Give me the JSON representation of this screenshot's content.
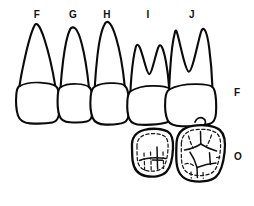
{
  "figure": {
    "kind": "dental-anatomy-line-drawing",
    "background_color": "#ffffff",
    "ink_color": "#0a0a0a",
    "tooth_labels": [
      {
        "id": "tooth-label-f",
        "text": "F",
        "x": 30
      },
      {
        "id": "tooth-label-g",
        "text": "G",
        "x": 66
      },
      {
        "id": "tooth-label-h",
        "text": "H",
        "x": 100
      },
      {
        "id": "tooth-label-i",
        "text": "I",
        "x": 141
      },
      {
        "id": "tooth-label-j",
        "text": "J",
        "x": 185
      }
    ],
    "view_labels": [
      {
        "id": "view-label-facial",
        "text": "F",
        "y": 88
      },
      {
        "id": "view-label-occlusal",
        "text": "O",
        "y": 152
      }
    ],
    "rows": [
      {
        "name": "facial-view-row",
        "abbrev": "F",
        "teeth": [
          "F",
          "G",
          "H",
          "I",
          "J"
        ]
      },
      {
        "name": "occlusal-view-row",
        "abbrev": "O",
        "teeth": [
          "I",
          "J"
        ]
      }
    ]
  }
}
